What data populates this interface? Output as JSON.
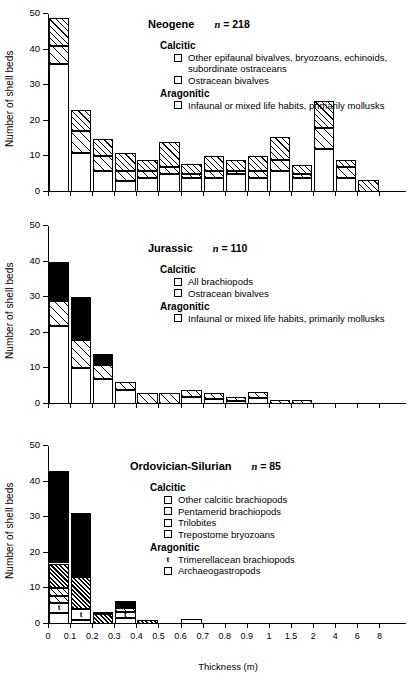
{
  "figure": {
    "ylabel": "Number of shell beds",
    "xlabel": "Thickness (m)",
    "yticks": [
      "0",
      "10",
      "20",
      "30",
      "40",
      "50"
    ],
    "ylim": [
      0,
      50
    ],
    "xticks": [
      "0",
      "0.1",
      "0.2",
      "0.3",
      "0.4",
      "0.5",
      "0.6",
      "0.7",
      "0.8",
      "0.9",
      "1",
      "1.5",
      "2",
      "4",
      "6",
      "8"
    ],
    "headings": {
      "calcitic": "Calcitic",
      "aragonitic": "Aragonitic"
    }
  },
  "chart_data": {
    "type": "bar",
    "xlabel": "Thickness (m)",
    "ylabel": "Number of shell beds",
    "ylim": [
      0,
      50
    ],
    "grid": false,
    "stacked": true,
    "categories": [
      "0",
      "0.1",
      "0.2",
      "0.3",
      "0.4",
      "0.5",
      "0.6",
      "0.7",
      "0.8",
      "0.9",
      "1",
      "1.5",
      "2",
      "4",
      "6",
      "8"
    ],
    "panels": [
      {
        "name": "Neogene",
        "n_label": "n = 218",
        "n": 218,
        "series": [
          {
            "name": "Infaunal or mixed life habits, primarily mollusks",
            "fill": "white",
            "values": [
              36,
              11,
              6,
              3,
              4,
              5,
              4,
              4,
              5,
              4,
              6,
              4,
              12,
              4,
              0
            ]
          },
          {
            "name": "Ostracean bivalves",
            "fill": "hatch-b",
            "values": [
              5,
              6,
              4,
              3,
              2,
              2,
              1,
              2,
              1,
              2,
              3,
              1,
              6,
              3,
              0
            ]
          },
          {
            "name": "Other epifaunal bivalves, bryozoans, echinoids, subordinate ostraceans",
            "fill": "hatch-a",
            "values": [
              8,
              6,
              5,
              5,
              3,
              7,
              3,
              4,
              3,
              4,
              6.5,
              2.5,
              7.5,
              2,
              3.5
            ]
          }
        ],
        "totals": [
          49,
          23,
          15,
          11,
          9,
          14,
          8,
          10,
          9,
          10,
          15.5,
          7.5,
          25.5,
          9,
          3.5
        ],
        "legend": {
          "calcitic": [
            {
              "label": "Other epifaunal bivalves, bryozoans, echinoids, subordinate ostraceans",
              "swatch": "hatch-a"
            },
            {
              "label": "Ostracean bivalves",
              "swatch": "hatch-b"
            }
          ],
          "aragonitic": [
            {
              "label": "Infaunal or mixed life habits, primarily mollusks",
              "swatch": "white"
            }
          ]
        }
      },
      {
        "name": "Jurassic",
        "n_label": "n = 110",
        "n": 110,
        "series": [
          {
            "name": "Infaunal or mixed life habits, primarily mollusks",
            "fill": "white",
            "values": [
              22,
              10,
              7,
              4,
              0,
              0,
              2,
              1.5,
              0.8,
              1.8,
              0,
              0,
              0,
              0,
              0
            ]
          },
          {
            "name": "Ostracean bivalves",
            "fill": "hatch-b",
            "values": [
              7,
              8,
              4,
              2.3,
              3,
              3,
              2,
              1.7,
              1.2,
              1.7,
              1.2,
              1.2,
              0,
              0,
              0
            ]
          },
          {
            "name": "All brachiopods",
            "fill": "black",
            "values": [
              11,
              12,
              3,
              0,
              0,
              0,
              0,
              0,
              0,
              0,
              0,
              0,
              0,
              0,
              0
            ]
          }
        ],
        "totals": [
          40,
          30,
          14,
          6.3,
          3,
          3,
          4,
          3.2,
          2,
          3.5,
          1.2,
          1.2,
          0,
          0,
          0
        ],
        "legend": {
          "calcitic": [
            {
              "label": "All brachiopods",
              "swatch": "black"
            },
            {
              "label": "Ostracean bivalves",
              "swatch": "hatch-b"
            }
          ],
          "aragonitic": [
            {
              "label": "Infaunal or mixed life habits, primarily mollusks",
              "swatch": "white"
            }
          ]
        }
      },
      {
        "name": "Ordovician-Silurian",
        "n_label": "n = 85",
        "n": 85,
        "series": [
          {
            "name": "Archaeogastropods",
            "fill": "white",
            "values": [
              3,
              1,
              0,
              1.8,
              0,
              0,
              1.5,
              0,
              0,
              0,
              0,
              0,
              0,
              0,
              0
            ]
          },
          {
            "name": "Trimerellacean brachiopods",
            "fill": "white-t",
            "values": [
              3,
              3.2,
              0,
              1.6,
              0,
              0,
              0,
              0,
              0,
              0,
              0,
              0,
              0,
              0,
              0
            ]
          },
          {
            "name": "Trepostome bryozoans",
            "fill": "hatch-b",
            "values": [
              2,
              0,
              0,
              1,
              0,
              0,
              0,
              0,
              0,
              0,
              0,
              0,
              0,
              0,
              0
            ]
          },
          {
            "name": "Trilobites",
            "fill": "hatch-a",
            "values": [
              2,
              0,
              0,
              0,
              0,
              0,
              0,
              0,
              0,
              0,
              0,
              0,
              0,
              0,
              0
            ]
          },
          {
            "name": "Pentamerid brachiopods",
            "fill": "hatch-dense",
            "values": [
              7,
              9,
              2.8,
              0.8,
              1.2,
              0,
              0,
              0,
              0,
              0,
              0,
              0,
              0,
              0,
              0
            ]
          },
          {
            "name": "Other calcitic brachiopods",
            "fill": "black",
            "values": [
              26,
              18,
              0.5,
              1.2,
              0,
              0,
              0,
              0,
              0,
              0,
              0,
              0,
              0,
              0,
              0
            ]
          }
        ],
        "totals": [
          43,
          31,
          3.3,
          6.4,
          1.2,
          0,
          1.5,
          0,
          0,
          0,
          0,
          0,
          0,
          0,
          0
        ],
        "t_markers": [
          {
            "bar": 0,
            "label": "t"
          },
          {
            "bar": 1,
            "label": "t"
          },
          {
            "bar": 3,
            "label": "t"
          }
        ],
        "legend": {
          "calcitic": [
            {
              "label": "Other calcitic brachiopods",
              "swatch": "black"
            },
            {
              "label": "Pentamerid brachiopods",
              "swatch": "hatch-dense"
            },
            {
              "label": "Trilobites",
              "swatch": "hatch-a"
            },
            {
              "label": "Trepostome bryozoans",
              "swatch": "hatch-b"
            }
          ],
          "aragonitic": [
            {
              "label": "Trimerellacean brachiopods",
              "swatch": "t"
            },
            {
              "label": "Archaeogastropods",
              "swatch": "white"
            }
          ]
        }
      }
    ]
  }
}
